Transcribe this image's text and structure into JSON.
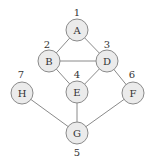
{
  "graph": {
    "nodes": [
      {
        "id": "A",
        "label": "A",
        "number": "1",
        "x": 77,
        "y": 30,
        "nx": 77,
        "ny": 12
      },
      {
        "id": "B",
        "label": "B",
        "number": "2",
        "x": 49,
        "y": 61,
        "nx": 47,
        "ny": 44
      },
      {
        "id": "D",
        "label": "D",
        "number": "3",
        "x": 107,
        "y": 61,
        "nx": 107,
        "ny": 44
      },
      {
        "id": "E",
        "label": "E",
        "number": "4",
        "x": 77,
        "y": 92,
        "nx": 77,
        "ny": 74
      },
      {
        "id": "H",
        "label": "H",
        "number": "7",
        "x": 22,
        "y": 93,
        "nx": 21,
        "ny": 74
      },
      {
        "id": "F",
        "label": "F",
        "number": "6",
        "x": 133,
        "y": 93,
        "nx": 132,
        "ny": 74
      },
      {
        "id": "G",
        "label": "G",
        "number": "5",
        "x": 77,
        "y": 133,
        "nx": 77,
        "ny": 152
      }
    ],
    "edges": [
      [
        "A",
        "B"
      ],
      [
        "A",
        "D"
      ],
      [
        "B",
        "D"
      ],
      [
        "B",
        "E"
      ],
      [
        "D",
        "E"
      ],
      [
        "D",
        "F"
      ],
      [
        "E",
        "G"
      ],
      [
        "H",
        "G"
      ],
      [
        "F",
        "G"
      ]
    ],
    "node_radius": 11
  }
}
